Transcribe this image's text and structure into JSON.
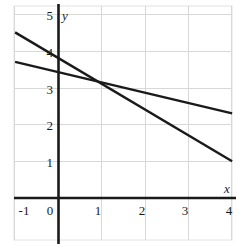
{
  "chart_data": {
    "type": "line",
    "title": "",
    "xlabel": "x",
    "ylabel": "y",
    "xlim": [
      -1,
      4
    ],
    "ylim": [
      0,
      5
    ],
    "grid": true,
    "legend": "none",
    "x_ticks": [
      "-1",
      "0",
      "1",
      "2",
      "3",
      "4"
    ],
    "x_tick_values": [
      -1,
      0,
      1,
      2,
      3,
      4
    ],
    "y_ticks": [
      "1",
      "2",
      "3",
      "4",
      "5"
    ],
    "y_tick_values": [
      1,
      2,
      3,
      4,
      5
    ],
    "series": [
      {
        "name": "steep-line",
        "slope": -0.7,
        "intercept": 3.8,
        "x": [
          -1,
          4
        ],
        "values": [
          4.5,
          1.0
        ],
        "color": "#1a1a1a"
      },
      {
        "name": "shallow-line",
        "slope": -0.28,
        "intercept": 3.42,
        "x": [
          -1,
          4
        ],
        "values": [
          3.7,
          2.3
        ],
        "color": "#1a1a1a"
      }
    ],
    "intersection": {
      "x": 1.0,
      "y": 3.1
    }
  },
  "axes": {
    "x_axis_label": "x",
    "y_axis_label": "y",
    "x_labels": [
      "-1",
      "0",
      "1",
      "2",
      "3",
      "4"
    ],
    "y_labels": [
      "5",
      "4",
      "3",
      "2",
      "1"
    ]
  },
  "colors": {
    "line": "#1a1a1a",
    "axis": "#1a1a1a",
    "grid": "#d8d8d8",
    "frame": "#e2e2e2",
    "background": "#ffffff",
    "text": "#1a1a1a"
  }
}
